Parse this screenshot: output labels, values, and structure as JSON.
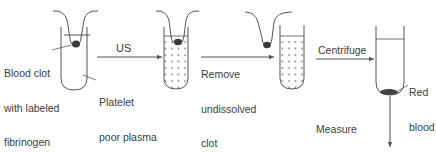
{
  "diagram": {
    "type": "process-flow",
    "steps": [
      {
        "id": "tube1",
        "labels": [
          "Blood clot with labeled fibrinogen",
          "Platelet poor plasma"
        ]
      },
      {
        "id": "tube2",
        "contents": "dissolved (dotted plasma)"
      },
      {
        "id": "tube3",
        "contents": "dotted plasma, clot removed"
      },
      {
        "id": "tube4",
        "labels": [
          "Red blood cells"
        ]
      }
    ],
    "arrows": [
      {
        "from": "tube1",
        "to": "tube2",
        "label": "US"
      },
      {
        "from": "tube2",
        "to": "tube3",
        "label": "Remove undissolved clot"
      },
      {
        "from": "tube3",
        "to": "tube4",
        "label": "Centrifuge"
      },
      {
        "from": "tube4",
        "to": "output",
        "label": "Measure fluorescence of supernatant"
      }
    ]
  },
  "labels": {
    "blood_clot_l1": "Blood clot",
    "blood_clot_l2": "with labeled",
    "blood_clot_l3": "fibrinogen",
    "platelet_l1": "Platelet",
    "platelet_l2": "poor plasma",
    "us": "US",
    "remove_l1": "Remove",
    "remove_l2": "undissolved",
    "remove_l3": "clot",
    "centrifuge": "Centrifuge",
    "rbc_l1": "Red",
    "rbc_l2": "blood",
    "rbc_l3": "cells",
    "measure_l1": "Measure",
    "measure_l2": "fluorescence of",
    "measure_l3": "supernatant"
  },
  "colors": {
    "stroke": "#555555",
    "clot": "#3a3a3a",
    "text": "#3c3c3c"
  }
}
